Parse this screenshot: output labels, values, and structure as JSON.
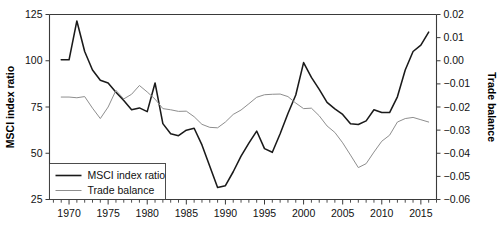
{
  "chart_data": {
    "type": "line",
    "title": "",
    "subtitle": "",
    "xlabel": "",
    "ylabel": "MSCI index ratio",
    "y2label": "Trade balance",
    "grid": false,
    "legend_position": "bottom-left",
    "xlim": [
      1967.5,
      2017.0
    ],
    "ylim": [
      25,
      125
    ],
    "y2lim": [
      -0.06,
      0.02
    ],
    "xticks": [
      1970,
      1975,
      1980,
      1985,
      1990,
      1995,
      2000,
      2005,
      2010,
      2015
    ],
    "xtick_labels": [
      "1970",
      "1975",
      "1980",
      "1985",
      "1990",
      "1995",
      "2000",
      "2005",
      "2010",
      "2015"
    ],
    "xminor_step": 1,
    "yticks": [
      25,
      50,
      75,
      100,
      125
    ],
    "ytick_labels": [
      "25",
      "50",
      "75",
      "100",
      "125"
    ],
    "y2ticks": [
      -0.06,
      -0.05,
      -0.04,
      -0.03,
      -0.02,
      -0.01,
      0.0,
      0.01,
      0.02
    ],
    "y2tick_labels": [
      "−0.06",
      "−0.05",
      "−0.04",
      "−0.03",
      "−0.02",
      "−0.01",
      "0.00",
      "0.01",
      "0.02"
    ],
    "colors": {
      "msci": "#1a1a1a",
      "trade": "#8e8e8e",
      "axis": "#3a3a3a"
    },
    "x": [
      1969,
      1970,
      1971,
      1972,
      1973,
      1974,
      1975,
      1976,
      1977,
      1978,
      1979,
      1980,
      1981,
      1982,
      1983,
      1984,
      1985,
      1986,
      1987,
      1988,
      1989,
      1990,
      1991,
      1992,
      1993,
      1994,
      1995,
      1996,
      1997,
      1998,
      1999,
      2000,
      2001,
      2002,
      2003,
      2004,
      2005,
      2006,
      2007,
      2008,
      2009,
      2010,
      2011,
      2012,
      2013,
      2014,
      2015,
      2016
    ],
    "series": [
      {
        "name": "MSCI index ratio",
        "axis": "left",
        "values": [
          100.5,
          100.5,
          121.5,
          105.0,
          95.0,
          89.5,
          88.0,
          83.0,
          78.5,
          73.5,
          74.5,
          72.5,
          88.0,
          66.0,
          60.5,
          59.5,
          62.5,
          63.5,
          54.5,
          43.0,
          31.5,
          32.5,
          40.0,
          48.5,
          55.5,
          62.0,
          52.5,
          50.5,
          60.5,
          71.5,
          81.5,
          99.0,
          91.0,
          84.5,
          77.5,
          74.0,
          71.0,
          66.0,
          65.5,
          67.5,
          73.5,
          72.0,
          72.0,
          80.5,
          95.0,
          105.0,
          108.5,
          115.5
        ]
      },
      {
        "name": "Trade balance",
        "axis": "right",
        "values": [
          -0.0157,
          -0.0157,
          -0.016,
          -0.0155,
          -0.0205,
          -0.025,
          -0.02,
          -0.0128,
          -0.0165,
          -0.0145,
          -0.0107,
          -0.0135,
          -0.0166,
          -0.0207,
          -0.0212,
          -0.0219,
          -0.0218,
          -0.0242,
          -0.0275,
          -0.0288,
          -0.029,
          -0.0265,
          -0.0232,
          -0.0213,
          -0.0186,
          -0.0158,
          -0.0147,
          -0.0145,
          -0.0144,
          -0.0155,
          -0.0183,
          -0.0207,
          -0.0205,
          -0.0238,
          -0.0282,
          -0.031,
          -0.0355,
          -0.0408,
          -0.0462,
          -0.0445,
          -0.0395,
          -0.0348,
          -0.0322,
          -0.0265,
          -0.025,
          -0.0245,
          -0.0255,
          -0.0265
        ]
      }
    ],
    "legend": [
      {
        "label": "MSCI index ratio",
        "color": "#1a1a1a",
        "width": 1.6
      },
      {
        "label": "Trade balance",
        "color": "#8e8e8e",
        "width": 1.0
      }
    ]
  }
}
